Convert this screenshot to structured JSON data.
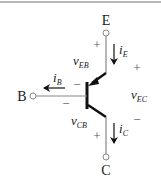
{
  "diagram": {
    "type": "pnp-bjt-circuit",
    "terminals": {
      "emitter": "E",
      "base": "B",
      "collector": "C"
    },
    "currents": {
      "emitter": {
        "symbol": "i",
        "sub": "E",
        "direction": "down"
      },
      "base": {
        "symbol": "i",
        "sub": "B",
        "direction": "left"
      },
      "collector": {
        "symbol": "i",
        "sub": "C",
        "direction": "down"
      }
    },
    "voltages": {
      "v_EB": {
        "symbol": "v",
        "sub": "EB",
        "plus": "+",
        "minus": "−"
      },
      "v_CB": {
        "symbol": "v",
        "sub": "CB",
        "plus": "+",
        "minus": "−"
      },
      "v_EC": {
        "symbol": "v",
        "sub": "EC",
        "plus": "+",
        "minus": "−"
      }
    },
    "colors": {
      "wire": "#888888",
      "transistor": "#111111",
      "text": "#1a1a1a",
      "top_rule": "#b8b8b8"
    }
  }
}
